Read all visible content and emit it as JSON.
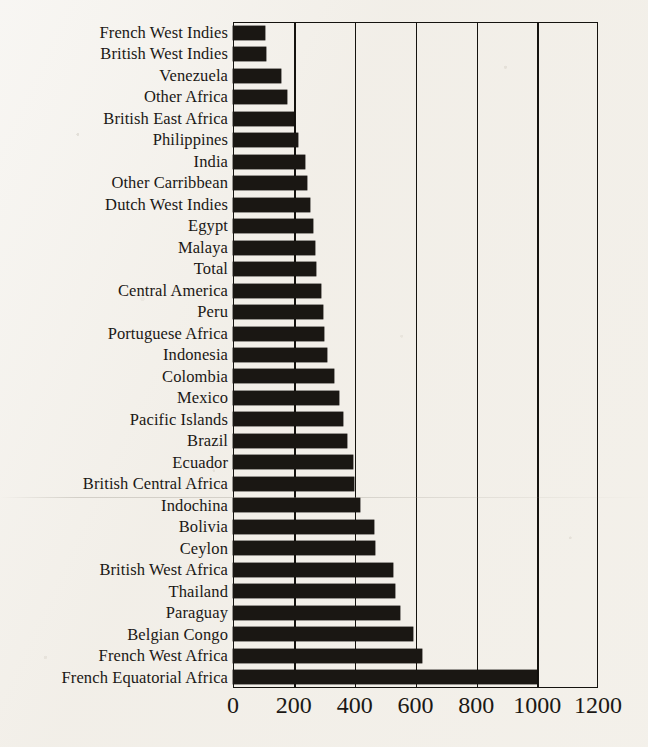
{
  "chart_data": {
    "type": "bar",
    "orientation": "horizontal",
    "title": "",
    "subtitle": "",
    "xlabel": "",
    "ylabel": "",
    "xlim": [
      0,
      1200
    ],
    "xticks": [
      0,
      200,
      400,
      600,
      800,
      1000,
      1200
    ],
    "xtick_labels": [
      "0",
      "200",
      "400",
      "600",
      "800",
      "1000",
      "1200"
    ],
    "grid": "vertical",
    "legend": "none",
    "bar_color": "#1a1713",
    "axis_color": "#15130f",
    "background_color": "#f2efe9",
    "categories": [
      "French West Indies",
      "British West Indies",
      "Venezuela",
      "Other Africa",
      "British East Africa",
      "Philippines",
      "India",
      "Other Carribbean",
      "Dutch West Indies",
      "Egypt",
      "Malaya",
      "Total",
      "Central America",
      "Peru",
      "Portuguese Africa",
      "Indonesia",
      "Colombia",
      "Mexico",
      "Pacific Islands",
      "Brazil",
      "Ecuador",
      "British Central Africa",
      "Indochina",
      "Bolivia",
      "Ceylon",
      "British West Africa",
      "Thailand",
      "Paraguay",
      "Belgian Congo",
      "French West Africa",
      "French Equatorial Africa"
    ],
    "values": [
      105,
      110,
      158,
      178,
      200,
      215,
      237,
      243,
      253,
      262,
      270,
      272,
      290,
      295,
      298,
      310,
      333,
      347,
      363,
      375,
      393,
      398,
      417,
      462,
      467,
      527,
      531,
      548,
      592,
      622,
      1000
    ]
  }
}
